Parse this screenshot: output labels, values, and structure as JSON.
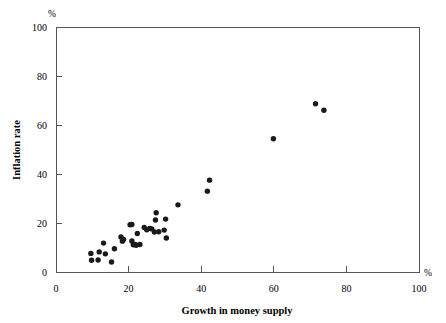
{
  "chart_data": {
    "type": "scatter",
    "title": "",
    "xlabel": "Growth in money supply",
    "ylabel": "Inflation rate",
    "x_unit_symbol": "%",
    "y_unit_symbol": "%",
    "xlim": [
      0,
      100
    ],
    "ylim": [
      0,
      100
    ],
    "xticks": [
      0,
      20,
      40,
      60,
      80,
      100
    ],
    "yticks": [
      0,
      20,
      40,
      60,
      80,
      100
    ],
    "xtick_labels": [
      "0",
      "20",
      "40",
      "60",
      "80",
      "100"
    ],
    "ytick_labels": [
      "0",
      "20",
      "40",
      "60",
      "80",
      "100"
    ],
    "grid": false,
    "legend": false,
    "marker": "filled-circle",
    "marker_color": "#1a1a1a",
    "marker_size_px": 3.4,
    "points": [
      [
        9.6,
        7.6
      ],
      [
        9.8,
        4.8
      ],
      [
        11.6,
        4.9
      ],
      [
        11.9,
        8.2
      ],
      [
        13.1,
        11.8
      ],
      [
        13.6,
        7.4
      ],
      [
        15.3,
        4.1
      ],
      [
        16.1,
        9.5
      ],
      [
        17.9,
        14.3
      ],
      [
        18.3,
        12.6
      ],
      [
        18.6,
        13.3
      ],
      [
        20.4,
        19.3
      ],
      [
        20.9,
        19.4
      ],
      [
        20.9,
        12.7
      ],
      [
        21.3,
        11.1
      ],
      [
        21.8,
        11.2
      ],
      [
        22.1,
        10.9
      ],
      [
        22.4,
        15.7
      ],
      [
        23.1,
        11.2
      ],
      [
        24.3,
        18.2
      ],
      [
        25.0,
        17.2
      ],
      [
        25.8,
        17.8
      ],
      [
        26.4,
        17.6
      ],
      [
        27.1,
        16.3
      ],
      [
        27.4,
        21.2
      ],
      [
        27.6,
        24.2
      ],
      [
        28.3,
        16.4
      ],
      [
        29.8,
        17.1
      ],
      [
        30.2,
        21.6
      ],
      [
        30.4,
        13.9
      ],
      [
        33.6,
        27.4
      ],
      [
        41.7,
        33.0
      ],
      [
        42.3,
        37.5
      ],
      [
        59.9,
        54.4
      ],
      [
        71.5,
        68.7
      ],
      [
        73.8,
        66.0
      ]
    ]
  }
}
